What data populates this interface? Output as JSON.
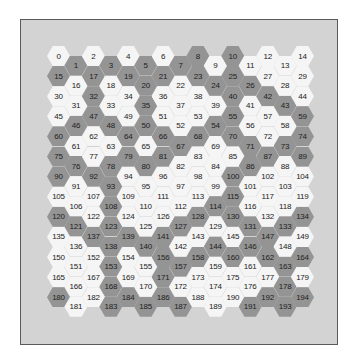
{
  "grid": {
    "columns": 15,
    "rows": 13,
    "colors": {
      "white": "#f5f5f5",
      "grey": "#949494"
    },
    "layout": {
      "origin_x": 47,
      "origin_y": 46,
      "col_step": 17.43,
      "row_step": 20.1,
      "odd_col_offset": 9.6
    },
    "cells_by_row": [
      [
        "W",
        "G",
        "W",
        "G",
        "W",
        "G",
        "W",
        "G",
        "G",
        "W",
        "G",
        "W",
        "W",
        "W",
        "W"
      ],
      [
        "G",
        "W",
        "G",
        "W",
        "G",
        "G",
        "G",
        "W",
        "G",
        "G",
        "G",
        "G",
        "W",
        "W",
        "W"
      ],
      [
        "W",
        "W",
        "G",
        "W",
        "W",
        "G",
        "W",
        "W",
        "W",
        "W",
        "G",
        "W",
        "G",
        "G",
        "W"
      ],
      [
        "W",
        "G",
        "G",
        "G",
        "W",
        "G",
        "W",
        "W",
        "W",
        "G",
        "G",
        "W",
        "W",
        "W",
        "G"
      ],
      [
        "G",
        "W",
        "W",
        "W",
        "G",
        "W",
        "G",
        "G",
        "G",
        "W",
        "G",
        "G",
        "W",
        "G",
        "G"
      ],
      [
        "G",
        "G",
        "W",
        "G",
        "G",
        "G",
        "G",
        "W",
        "W",
        "W",
        "W",
        "G",
        "G",
        "W",
        "G"
      ],
      [
        "G",
        "W",
        "G",
        "G",
        "W",
        "W",
        "W",
        "W",
        "W",
        "W",
        "G",
        "W",
        "W",
        "W",
        "W"
      ],
      [
        "W",
        "W",
        "W",
        "G",
        "W",
        "W",
        "W",
        "W",
        "W",
        "G",
        "G",
        "W",
        "W",
        "W",
        "W"
      ],
      [
        "G",
        "G",
        "W",
        "G",
        "W",
        "W",
        "W",
        "G",
        "G",
        "W",
        "G",
        "G",
        "W",
        "G",
        "G"
      ],
      [
        "W",
        "W",
        "G",
        "G",
        "G",
        "G",
        "G",
        "W",
        "W",
        "G",
        "W",
        "G",
        "G",
        "W",
        "W"
      ],
      [
        "W",
        "W",
        "W",
        "G",
        "W",
        "W",
        "G",
        "G",
        "G",
        "W",
        "G",
        "W",
        "G",
        "G",
        "G"
      ],
      [
        "W",
        "W",
        "W",
        "G",
        "W",
        "W",
        "G",
        "W",
        "W",
        "W",
        "W",
        "W",
        "W",
        "G",
        "W"
      ],
      [
        "G",
        "W",
        "W",
        "G",
        "G",
        "G",
        "G",
        "G",
        "W",
        "W",
        "W",
        "G",
        "G",
        "G",
        "G"
      ]
    ]
  }
}
